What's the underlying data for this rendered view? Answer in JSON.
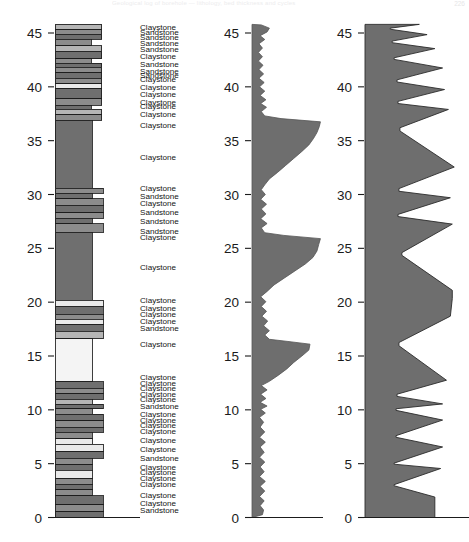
{
  "page": {
    "header_text": "Geological log of borehole — lithology, bed thickness and cycles",
    "page_number": "226"
  },
  "axes": {
    "ticks": [
      0,
      5,
      10,
      15,
      20,
      25,
      30,
      35,
      40,
      45
    ],
    "tick_labels": [
      "0",
      "5",
      "10",
      "15",
      "20",
      "25",
      "30",
      "35",
      "40",
      "45"
    ],
    "min": 0,
    "max": 45.8,
    "baseline_label": "0"
  },
  "colors": {
    "ink": "#1b1b1b",
    "claystone_dark": "#6f6f6f",
    "claystone_mid": "#8c8c8c",
    "siltstone_light": "#b5b5b5",
    "sandstone_pale": "#eaeaea",
    "curve_fill": "#6e6e6e",
    "cycle_fill": "#6e6e6e",
    "background": "#ffffff"
  },
  "panels": {
    "lithology": {
      "name": "Lithology column",
      "bed_count": 62
    },
    "labels": {
      "name": "Lithology unit names"
    },
    "curve": {
      "name": "Bed thickness curve",
      "fill": "#6e6e6e"
    },
    "cycles": {
      "name": "Sedimentary cycles (sawtooth)",
      "fill": "#6e6e6e"
    }
  },
  "chart_data": {
    "type": "area",
    "title": "",
    "xlabel": "",
    "ylabel": "",
    "ylim": [
      0,
      45.8
    ],
    "grid": false,
    "legend": "none",
    "lithology_beds": [
      {
        "top": 45.8,
        "base": 45.3,
        "width": 0.78,
        "shade": "#b5b5b5"
      },
      {
        "top": 45.3,
        "base": 44.9,
        "width": 0.78,
        "shade": "#8c8c8c"
      },
      {
        "top": 44.9,
        "base": 44.4,
        "width": 0.78,
        "shade": "#6f6f6f"
      },
      {
        "top": 44.4,
        "base": 43.8,
        "width": 0.6,
        "shade": "#8c8c8c"
      },
      {
        "top": 43.8,
        "base": 43.3,
        "width": 0.78,
        "shade": "#b5b5b5"
      },
      {
        "top": 43.3,
        "base": 42.6,
        "width": 0.78,
        "shade": "#6f6f6f"
      },
      {
        "top": 42.6,
        "base": 42.2,
        "width": 0.6,
        "shade": "#8c8c8c"
      },
      {
        "top": 42.2,
        "base": 41.8,
        "width": 0.78,
        "shade": "#6f6f6f"
      },
      {
        "top": 41.8,
        "base": 41.3,
        "width": 0.78,
        "shade": "#8c8c8c"
      },
      {
        "top": 41.3,
        "base": 40.8,
        "width": 0.78,
        "shade": "#6f6f6f"
      },
      {
        "top": 40.8,
        "base": 40.3,
        "width": 0.78,
        "shade": "#8c8c8c"
      },
      {
        "top": 40.3,
        "base": 39.8,
        "width": 0.78,
        "shade": "#eaeaea"
      },
      {
        "top": 39.8,
        "base": 38.9,
        "width": 0.78,
        "shade": "#6f6f6f"
      },
      {
        "top": 38.9,
        "base": 38.3,
        "width": 0.78,
        "shade": "#8c8c8c"
      },
      {
        "top": 38.3,
        "base": 37.9,
        "width": 0.6,
        "shade": "#6f6f6f"
      },
      {
        "top": 37.9,
        "base": 37.4,
        "width": 0.78,
        "shade": "#b5b5b5"
      },
      {
        "top": 37.4,
        "base": 36.9,
        "width": 0.78,
        "shade": "#8c8c8c"
      },
      {
        "top": 36.9,
        "base": 30.6,
        "width": 0.62,
        "shade": "#6f6f6f"
      },
      {
        "top": 30.6,
        "base": 30.1,
        "width": 0.8,
        "shade": "#8c8c8c"
      },
      {
        "top": 30.1,
        "base": 29.6,
        "width": 0.62,
        "shade": "#6f6f6f"
      },
      {
        "top": 29.6,
        "base": 29.0,
        "width": 0.8,
        "shade": "#8c8c8c"
      },
      {
        "top": 29.0,
        "base": 28.3,
        "width": 0.8,
        "shade": "#6f6f6f"
      },
      {
        "top": 28.3,
        "base": 27.8,
        "width": 0.8,
        "shade": "#8c8c8c"
      },
      {
        "top": 27.8,
        "base": 27.3,
        "width": 0.62,
        "shade": "#6f6f6f"
      },
      {
        "top": 27.3,
        "base": 26.5,
        "width": 0.8,
        "shade": "#8c8c8c"
      },
      {
        "top": 26.5,
        "base": 20.2,
        "width": 0.62,
        "shade": "#6f6f6f"
      },
      {
        "top": 20.2,
        "base": 19.6,
        "width": 0.8,
        "shade": "#eaeaea"
      },
      {
        "top": 19.6,
        "base": 18.9,
        "width": 0.8,
        "shade": "#6f6f6f"
      },
      {
        "top": 18.9,
        "base": 18.4,
        "width": 0.8,
        "shade": "#8c8c8c"
      },
      {
        "top": 18.4,
        "base": 17.9,
        "width": 0.8,
        "shade": "#eaeaea"
      },
      {
        "top": 17.9,
        "base": 17.3,
        "width": 0.8,
        "shade": "#6f6f6f"
      },
      {
        "top": 17.3,
        "base": 16.6,
        "width": 0.8,
        "shade": "#b5b5b5"
      },
      {
        "top": 16.6,
        "base": 12.6,
        "width": 0.62,
        "shade": "#f4f4f4"
      },
      {
        "top": 12.6,
        "base": 12.0,
        "width": 0.8,
        "shade": "#6f6f6f"
      },
      {
        "top": 12.0,
        "base": 11.5,
        "width": 0.8,
        "shade": "#8c8c8c"
      },
      {
        "top": 11.5,
        "base": 11.0,
        "width": 0.8,
        "shade": "#6f6f6f"
      },
      {
        "top": 11.0,
        "base": 10.5,
        "width": 0.62,
        "shade": "#b5b5b5"
      },
      {
        "top": 10.5,
        "base": 10.1,
        "width": 0.8,
        "shade": "#6f6f6f"
      },
      {
        "top": 10.1,
        "base": 9.6,
        "width": 0.62,
        "shade": "#8c8c8c"
      },
      {
        "top": 9.6,
        "base": 9.0,
        "width": 0.8,
        "shade": "#6f6f6f"
      },
      {
        "top": 9.0,
        "base": 8.4,
        "width": 0.8,
        "shade": "#8c8c8c"
      },
      {
        "top": 8.4,
        "base": 7.9,
        "width": 0.8,
        "shade": "#6f6f6f"
      },
      {
        "top": 7.9,
        "base": 7.3,
        "width": 0.62,
        "shade": "#8c8c8c"
      },
      {
        "top": 7.3,
        "base": 6.8,
        "width": 0.62,
        "shade": "#eaeaea"
      },
      {
        "top": 6.8,
        "base": 6.1,
        "width": 0.8,
        "shade": "#eaeaea"
      },
      {
        "top": 6.1,
        "base": 5.5,
        "width": 0.8,
        "shade": "#6f6f6f"
      },
      {
        "top": 5.5,
        "base": 4.9,
        "width": 0.62,
        "shade": "#8c8c8c"
      },
      {
        "top": 4.9,
        "base": 4.4,
        "width": 0.62,
        "shade": "#6f6f6f"
      },
      {
        "top": 4.4,
        "base": 3.6,
        "width": 0.62,
        "shade": "#eaeaea"
      },
      {
        "top": 3.6,
        "base": 3.1,
        "width": 0.62,
        "shade": "#8c8c8c"
      },
      {
        "top": 3.1,
        "base": 2.6,
        "width": 0.62,
        "shade": "#6f6f6f"
      },
      {
        "top": 2.6,
        "base": 2.0,
        "width": 0.62,
        "shade": "#8c8c8c"
      },
      {
        "top": 2.0,
        "base": 1.2,
        "width": 0.8,
        "shade": "#6f6f6f"
      },
      {
        "top": 1.2,
        "base": 0.55,
        "width": 0.8,
        "shade": "#8c8c8c"
      },
      {
        "top": 0.55,
        "base": 0.0,
        "width": 0.8,
        "shade": "#6f6f6f"
      }
    ],
    "unit_labels": [
      {
        "depth": 45.5,
        "text": "Claystone"
      },
      {
        "depth": 45.0,
        "text": "Sandstone"
      },
      {
        "depth": 44.5,
        "text": "Sandstone"
      },
      {
        "depth": 44.0,
        "text": "Sandstone"
      },
      {
        "depth": 43.4,
        "text": "Sandstone"
      },
      {
        "depth": 42.8,
        "text": "Claystone"
      },
      {
        "depth": 42.0,
        "text": "Sandstone"
      },
      {
        "depth": 41.4,
        "text": "Sandstone"
      },
      {
        "depth": 41.0,
        "text": "Sandstone"
      },
      {
        "depth": 40.6,
        "text": "Claystone"
      },
      {
        "depth": 39.9,
        "text": "Claystone"
      },
      {
        "depth": 39.2,
        "text": "Claystone"
      },
      {
        "depth": 38.5,
        "text": "Claystone"
      },
      {
        "depth": 38.1,
        "text": "Claystone"
      },
      {
        "depth": 37.4,
        "text": "Claystone"
      },
      {
        "depth": 36.4,
        "text": "Claystone"
      },
      {
        "depth": 33.4,
        "text": "Claystone"
      },
      {
        "depth": 30.5,
        "text": "Claystone"
      },
      {
        "depth": 29.8,
        "text": "Sandstone"
      },
      {
        "depth": 29.1,
        "text": "Claystone"
      },
      {
        "depth": 28.3,
        "text": "Sandstone"
      },
      {
        "depth": 27.4,
        "text": "Sandstone"
      },
      {
        "depth": 26.5,
        "text": "Sandstone"
      },
      {
        "depth": 26.0,
        "text": "Claystone"
      },
      {
        "depth": 23.2,
        "text": "Claystone"
      },
      {
        "depth": 20.1,
        "text": "Claystone"
      },
      {
        "depth": 19.4,
        "text": "Claystone"
      },
      {
        "depth": 18.8,
        "text": "Claystone"
      },
      {
        "depth": 18.2,
        "text": "Claystone"
      },
      {
        "depth": 17.5,
        "text": "Sandstone"
      },
      {
        "depth": 16.0,
        "text": "Claystone"
      },
      {
        "depth": 13.0,
        "text": "Claystone"
      },
      {
        "depth": 12.4,
        "text": "Claystone"
      },
      {
        "depth": 11.9,
        "text": "Claystone"
      },
      {
        "depth": 11.4,
        "text": "Claystone"
      },
      {
        "depth": 10.9,
        "text": "Claystone"
      },
      {
        "depth": 10.3,
        "text": "Sandstone"
      },
      {
        "depth": 9.5,
        "text": "Claystone"
      },
      {
        "depth": 9.0,
        "text": "Claystone"
      },
      {
        "depth": 8.5,
        "text": "Claystone"
      },
      {
        "depth": 7.9,
        "text": "Claystone"
      },
      {
        "depth": 7.1,
        "text": "Claystone"
      },
      {
        "depth": 6.3,
        "text": "Claystone"
      },
      {
        "depth": 5.4,
        "text": "Sandstone"
      },
      {
        "depth": 4.6,
        "text": "Claystone"
      },
      {
        "depth": 4.1,
        "text": "Claystone"
      },
      {
        "depth": 3.6,
        "text": "Claystone"
      },
      {
        "depth": 3.0,
        "text": "Claystone"
      },
      {
        "depth": 2.0,
        "text": "Claystone"
      },
      {
        "depth": 1.3,
        "text": "Claystone"
      },
      {
        "depth": 0.6,
        "text": "Sandstone"
      }
    ],
    "thickness_curve": {
      "ylabel": "",
      "points": [
        [
          0.0,
          0.0
        ],
        [
          0.18,
          0.26
        ],
        [
          0.2,
          0.7
        ],
        [
          0.14,
          1.1
        ],
        [
          0.21,
          1.55
        ],
        [
          0.13,
          1.95
        ],
        [
          0.22,
          2.45
        ],
        [
          0.14,
          2.9
        ],
        [
          0.23,
          3.35
        ],
        [
          0.13,
          3.8
        ],
        [
          0.21,
          4.25
        ],
        [
          0.14,
          4.7
        ],
        [
          0.22,
          5.15
        ],
        [
          0.13,
          5.6
        ],
        [
          0.21,
          6.05
        ],
        [
          0.14,
          6.55
        ],
        [
          0.23,
          7.0
        ],
        [
          0.13,
          7.45
        ],
        [
          0.22,
          7.95
        ],
        [
          0.14,
          8.4
        ],
        [
          0.2,
          8.85
        ],
        [
          0.13,
          9.3
        ],
        [
          0.23,
          9.7
        ],
        [
          0.15,
          10.05
        ],
        [
          0.26,
          10.35
        ],
        [
          0.14,
          10.7
        ],
        [
          0.24,
          11.05
        ],
        [
          0.15,
          11.45
        ],
        [
          0.26,
          11.85
        ],
        [
          0.16,
          12.25
        ],
        [
          0.3,
          12.65
        ],
        [
          0.45,
          13.2
        ],
        [
          0.6,
          13.8
        ],
        [
          0.72,
          14.4
        ],
        [
          0.86,
          15.0
        ],
        [
          0.98,
          15.55
        ],
        [
          1.0,
          16.1
        ],
        [
          0.62,
          16.35
        ],
        [
          0.3,
          16.55
        ],
        [
          0.22,
          16.95
        ],
        [
          0.3,
          17.35
        ],
        [
          0.2,
          17.8
        ],
        [
          0.27,
          18.25
        ],
        [
          0.17,
          18.7
        ],
        [
          0.25,
          19.15
        ],
        [
          0.16,
          19.6
        ],
        [
          0.24,
          20.05
        ],
        [
          0.15,
          20.5
        ],
        [
          0.26,
          21.0
        ],
        [
          0.38,
          21.6
        ],
        [
          0.56,
          22.25
        ],
        [
          0.74,
          22.9
        ],
        [
          0.92,
          23.55
        ],
        [
          1.05,
          24.15
        ],
        [
          1.12,
          24.75
        ],
        [
          1.15,
          25.35
        ],
        [
          1.18,
          25.9
        ],
        [
          0.55,
          26.2
        ],
        [
          0.22,
          26.45
        ],
        [
          0.16,
          26.9
        ],
        [
          0.26,
          27.3
        ],
        [
          0.15,
          27.75
        ],
        [
          0.24,
          28.2
        ],
        [
          0.16,
          28.65
        ],
        [
          0.25,
          29.1
        ],
        [
          0.15,
          29.55
        ],
        [
          0.23,
          30.0
        ],
        [
          0.16,
          30.45
        ],
        [
          0.22,
          30.9
        ],
        [
          0.3,
          31.45
        ],
        [
          0.44,
          32.05
        ],
        [
          0.58,
          32.7
        ],
        [
          0.72,
          33.35
        ],
        [
          0.86,
          34.0
        ],
        [
          0.98,
          34.6
        ],
        [
          1.06,
          35.2
        ],
        [
          1.12,
          35.75
        ],
        [
          1.16,
          36.3
        ],
        [
          1.18,
          36.75
        ],
        [
          0.5,
          37.05
        ],
        [
          0.22,
          37.3
        ],
        [
          0.16,
          37.7
        ],
        [
          0.25,
          38.1
        ],
        [
          0.15,
          38.45
        ],
        [
          0.24,
          38.8
        ],
        [
          0.14,
          39.2
        ],
        [
          0.22,
          39.6
        ],
        [
          0.13,
          40.0
        ],
        [
          0.21,
          40.4
        ],
        [
          0.12,
          40.8
        ],
        [
          0.2,
          41.2
        ],
        [
          0.12,
          41.6
        ],
        [
          0.19,
          42.0
        ],
        [
          0.11,
          42.4
        ],
        [
          0.18,
          42.8
        ],
        [
          0.11,
          43.2
        ],
        [
          0.18,
          43.6
        ],
        [
          0.12,
          44.0
        ],
        [
          0.22,
          44.4
        ],
        [
          0.14,
          44.75
        ],
        [
          0.26,
          45.1
        ],
        [
          0.3,
          45.45
        ],
        [
          0.16,
          45.75
        ],
        [
          0.0,
          45.8
        ]
      ]
    },
    "cycles_curve": {
      "ylabel": "",
      "points": [
        [
          0.0,
          0.0
        ],
        [
          0.72,
          0.0
        ],
        [
          0.72,
          1.9
        ],
        [
          0.3,
          2.95
        ],
        [
          0.3,
          3.05
        ],
        [
          0.78,
          4.55
        ],
        [
          0.3,
          4.95
        ],
        [
          0.3,
          5.05
        ],
        [
          0.8,
          6.55
        ],
        [
          0.32,
          7.45
        ],
        [
          0.32,
          7.6
        ],
        [
          0.8,
          9.05
        ],
        [
          0.32,
          9.95
        ],
        [
          0.32,
          10.1
        ],
        [
          0.8,
          10.55
        ],
        [
          0.33,
          11.25
        ],
        [
          0.33,
          11.45
        ],
        [
          0.84,
          12.75
        ],
        [
          0.35,
          15.95
        ],
        [
          0.35,
          16.25
        ],
        [
          0.88,
          18.7
        ],
        [
          0.9,
          20.35
        ],
        [
          0.9,
          21.1
        ],
        [
          0.38,
          24.35
        ],
        [
          0.38,
          24.6
        ],
        [
          0.9,
          27.25
        ],
        [
          0.34,
          27.95
        ],
        [
          0.34,
          28.15
        ],
        [
          0.88,
          29.7
        ],
        [
          0.35,
          30.3
        ],
        [
          0.35,
          30.55
        ],
        [
          0.92,
          32.55
        ],
        [
          0.36,
          35.9
        ],
        [
          0.36,
          36.2
        ],
        [
          0.86,
          37.9
        ],
        [
          0.34,
          38.45
        ],
        [
          0.34,
          38.65
        ],
        [
          0.82,
          39.75
        ],
        [
          0.33,
          40.45
        ],
        [
          0.33,
          40.65
        ],
        [
          0.8,
          41.75
        ],
        [
          0.3,
          42.55
        ],
        [
          0.3,
          42.7
        ],
        [
          0.72,
          43.55
        ],
        [
          0.28,
          44.1
        ],
        [
          0.28,
          44.25
        ],
        [
          0.64,
          44.85
        ],
        [
          0.26,
          45.35
        ],
        [
          0.26,
          45.45
        ],
        [
          0.56,
          45.8
        ],
        [
          0.0,
          45.8
        ]
      ]
    }
  }
}
